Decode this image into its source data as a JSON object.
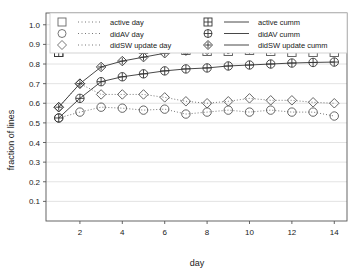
{
  "chart_data": {
    "type": "line",
    "title": "",
    "xlabel": "day",
    "ylabel": "fraction of lines",
    "xlim": [
      0.4,
      14.6
    ],
    "ylim": [
      0.0,
      1.06
    ],
    "xticks": [
      2,
      4,
      6,
      8,
      10,
      12,
      14
    ],
    "yticks": [
      0.1,
      0.2,
      0.3,
      0.4,
      0.5,
      0.6,
      0.7,
      0.8,
      0.9,
      1.0
    ],
    "ytick_labels": [
      "0.1",
      "0.2",
      "0.3",
      "0.4",
      "0.5",
      "0.6",
      "0.7",
      "0.8",
      "0.9",
      "1.0"
    ],
    "xtick_labels": [
      "2",
      "4",
      "6",
      "8",
      "10",
      "12",
      "14"
    ],
    "grid": true,
    "grid_axis": "y",
    "legend_position": "top",
    "legend_columns": 2,
    "x": [
      1,
      2,
      3,
      4,
      5,
      6,
      7,
      8,
      9,
      10,
      11,
      12,
      13,
      14
    ],
    "series": [
      {
        "name": "active day",
        "marker": "square",
        "linestyle": "dotted",
        "color": "#555555",
        "values": [
          0.86,
          0.9,
          0.885,
          0.89,
          0.875,
          0.875,
          0.87,
          0.865,
          0.865,
          0.87,
          0.865,
          0.86,
          0.86,
          0.86
        ]
      },
      {
        "name": "didAV day",
        "marker": "circle",
        "linestyle": "dotted",
        "color": "#555555",
        "values": [
          0.525,
          0.555,
          0.58,
          0.575,
          0.565,
          0.57,
          0.545,
          0.555,
          0.565,
          0.555,
          0.565,
          0.555,
          0.555,
          0.535
        ]
      },
      {
        "name": "didSW update day",
        "marker": "diamond",
        "linestyle": "dotted",
        "color": "#555555",
        "values": [
          0.58,
          0.7,
          0.645,
          0.645,
          0.645,
          0.63,
          0.61,
          0.6,
          0.61,
          0.625,
          0.615,
          0.615,
          0.605,
          0.6
        ]
      },
      {
        "name": "active cumm",
        "marker": "square-plus",
        "linestyle": "solid",
        "color": "#333333",
        "values": [
          0.86,
          0.92,
          0.945,
          0.96,
          0.97,
          0.97,
          0.975,
          0.98,
          0.98,
          0.985,
          0.99,
          0.99,
          0.995,
          1.0
        ]
      },
      {
        "name": "didAV cumm",
        "marker": "circle-plus",
        "linestyle": "solid",
        "color": "#333333",
        "values": [
          0.525,
          0.625,
          0.71,
          0.735,
          0.75,
          0.765,
          0.775,
          0.78,
          0.79,
          0.795,
          0.8,
          0.805,
          0.808,
          0.81
        ]
      },
      {
        "name": "didSW update cumm",
        "marker": "diamond-plus",
        "linestyle": "solid",
        "color": "#333333",
        "values": [
          0.58,
          0.7,
          0.785,
          0.815,
          0.835,
          0.855,
          0.868,
          0.872,
          0.875,
          0.878,
          0.879,
          0.881,
          0.883,
          0.885
        ]
      }
    ]
  },
  "legend": {
    "left_column": [
      {
        "label": "active day",
        "marker": "square",
        "line": "dotted"
      },
      {
        "label": "didAV day",
        "marker": "circle",
        "line": "dotted"
      },
      {
        "label": "didSW update day",
        "marker": "diamond",
        "line": "dotted"
      }
    ],
    "right_column": [
      {
        "label": "active cumm",
        "marker": "square-plus",
        "line": "solid"
      },
      {
        "label": "didAV cumm",
        "marker": "circle-plus",
        "line": "solid"
      },
      {
        "label": "didSW update cumm",
        "marker": "diamond-plus",
        "line": "solid"
      }
    ]
  },
  "colors": {
    "axis": "#555555",
    "grid": "#dcdcdc",
    "marker_light": "#666666",
    "marker_dark": "#333333",
    "background": "#ffffff",
    "frame": "#555555"
  }
}
